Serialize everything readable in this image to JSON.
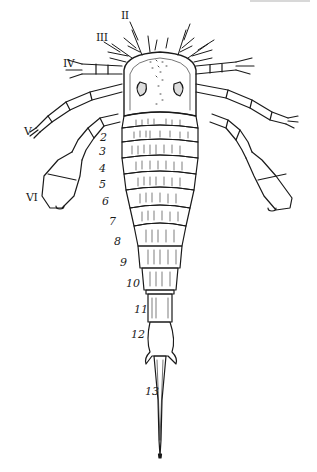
{
  "figure": {
    "colors": {
      "ink": "#1a1a1a",
      "background": "#ffffff"
    },
    "appendage_labels": [
      {
        "label": "II",
        "x": 121,
        "y": 10
      },
      {
        "label": "III",
        "x": 96,
        "y": 32
      },
      {
        "label": "IV",
        "x": 63,
        "y": 58
      },
      {
        "label": "V",
        "x": 24,
        "y": 126
      },
      {
        "label": "VI",
        "x": 26,
        "y": 192
      }
    ],
    "segment_labels": [
      {
        "label": "2",
        "x": 100,
        "y": 132
      },
      {
        "label": "3",
        "x": 99,
        "y": 146
      },
      {
        "label": "4",
        "x": 99,
        "y": 163
      },
      {
        "label": "5",
        "x": 99,
        "y": 179
      },
      {
        "label": "6",
        "x": 102,
        "y": 196
      },
      {
        "label": "7",
        "x": 109,
        "y": 216
      },
      {
        "label": "8",
        "x": 114,
        "y": 236
      },
      {
        "label": "9",
        "x": 120,
        "y": 257
      },
      {
        "label": "10",
        "x": 126,
        "y": 278
      },
      {
        "label": "11",
        "x": 134,
        "y": 304
      },
      {
        "label": "12",
        "x": 131,
        "y": 329
      },
      {
        "label": "13",
        "x": 145,
        "y": 386
      }
    ]
  }
}
